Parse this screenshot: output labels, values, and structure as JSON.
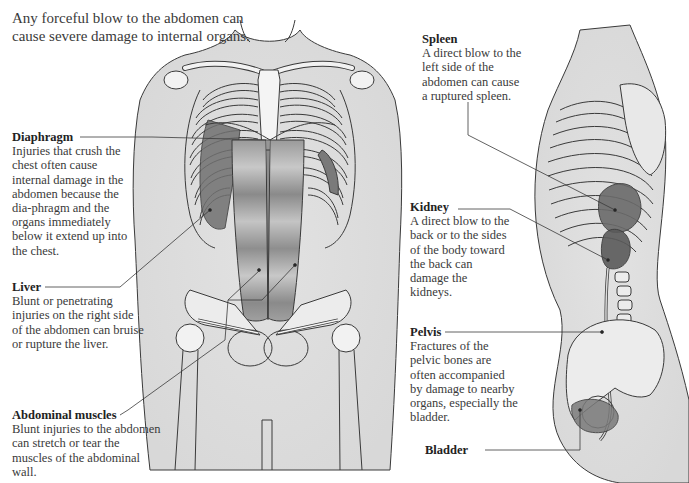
{
  "intro": {
    "text": "Any forceful blow to the abdomen can cause severe damage to internal organs."
  },
  "callouts": {
    "diaphragm": {
      "title": "Diaphragm",
      "body": "Injuries that crush the chest often cause internal damage in the abdomen because the dia-phragm and the organs immediately below it extend up into the chest."
    },
    "liver": {
      "title": "Liver",
      "body": "Blunt or penetrating injuries on the right side of the abdomen can bruise or rupture the liver."
    },
    "abdominal_muscles": {
      "title": "Abdominal muscles",
      "body": "Blunt injuries to the abdomen can stretch or tear the muscles of the abdominal wall."
    },
    "spleen": {
      "title": "Spleen",
      "body": "A direct blow to the left side of the abdomen can cause a ruptured spleen."
    },
    "kidney": {
      "title": "Kidney",
      "body": "A direct blow to the back or to the sides of the body toward the back can damage the kidneys."
    },
    "pelvis": {
      "title": "Pelvis",
      "body": "Fractures of the pelvic bones are often accompanied by damage to nearby organs, especially the bladder."
    },
    "bladder": {
      "title": "Bladder"
    }
  },
  "figures": {
    "front_view": "front-torso-illustration",
    "side_view": "side-torso-illustration"
  },
  "colors": {
    "skin": "#e6e6e6",
    "bone": "#f2f2f2",
    "organ_dark": "#6e6e6e",
    "organ_mid": "#9a9a9a",
    "line": "#3a3a3a",
    "text": "#3a3a3a"
  }
}
